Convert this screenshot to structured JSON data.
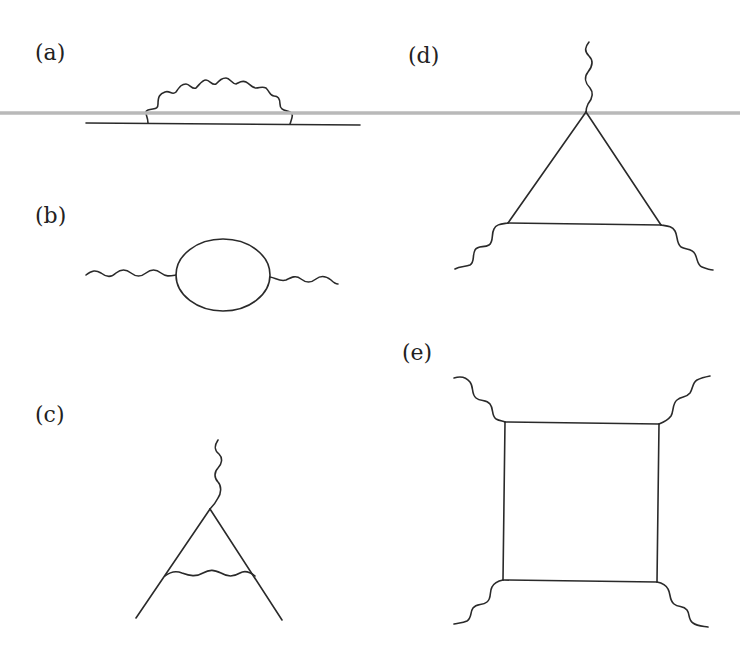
{
  "figure": {
    "panels": [
      {
        "id": "a",
        "label": "(a)",
        "description": "Fermion self-energy: straight fermion line with a wavy photon loop above"
      },
      {
        "id": "b",
        "label": "(b)",
        "description": "Vacuum polarization: wavy photon lines entering and leaving a fermion loop"
      },
      {
        "id": "c",
        "label": "(c)",
        "description": "Vertex correction: photon attaches to fermion vertex, internal photon exchanged between fermion legs"
      },
      {
        "id": "d",
        "label": "(d)",
        "description": "Triangle diagram: fermion triangle with three external photons"
      },
      {
        "id": "e",
        "label": "(e)",
        "description": "Box diagram: fermion box with four external photons"
      }
    ],
    "overlay_line_color": "#b9b9b9",
    "line_color": "#2a2a2a"
  }
}
